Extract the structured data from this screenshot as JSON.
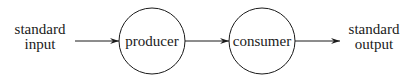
{
  "diagram": {
    "type": "pipeline",
    "nodes": [
      {
        "id": "stdin",
        "kind": "text",
        "lines": [
          "standard",
          "input"
        ]
      },
      {
        "id": "producer",
        "kind": "circle",
        "label": "producer"
      },
      {
        "id": "consumer",
        "kind": "circle",
        "label": "consumer"
      },
      {
        "id": "stdout",
        "kind": "text",
        "lines": [
          "standard",
          "output"
        ]
      }
    ],
    "edges": [
      {
        "from": "stdin",
        "to": "producer"
      },
      {
        "from": "producer",
        "to": "consumer"
      },
      {
        "from": "consumer",
        "to": "stdout"
      }
    ],
    "colors": {
      "stroke": "#1a1a1a",
      "background": "#ffffff"
    }
  }
}
